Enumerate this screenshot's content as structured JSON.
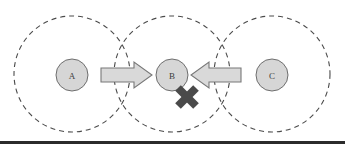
{
  "figure": {
    "name": "three-overlapping-dashed-circles-with-arrows",
    "width": 345,
    "height": 148,
    "background_color": "#ffffff"
  },
  "style": {
    "dashed_circle_stroke": "#4a4a4a",
    "dashed_circle_dash": "5 4",
    "dashed_circle_stroke_width": 1.1,
    "node_fill": "#d6d6d6",
    "node_stroke": "#6e6e6e",
    "node_stroke_width": 1,
    "node_label_color": "#3d3d3d",
    "arrow_fill": "#d9d9d9",
    "arrow_stroke": "#787878",
    "arrow_stroke_width": 1.1,
    "cross_color": "#4a4a4a",
    "bottom_rule_color": "#2b2b2b"
  },
  "regions": [
    {
      "id": "region-a",
      "cx": 72,
      "cy": 74,
      "r": 58,
      "dashed": true
    },
    {
      "id": "region-b",
      "cx": 172,
      "cy": 74,
      "r": 58,
      "dashed": true
    },
    {
      "id": "region-c",
      "cx": 272,
      "cy": 74,
      "r": 58,
      "dashed": true
    }
  ],
  "nodes": [
    {
      "id": "node-a",
      "label": "A",
      "cx": 72,
      "cy": 75,
      "r": 16
    },
    {
      "id": "node-b",
      "label": "B",
      "cx": 172,
      "cy": 75,
      "r": 16
    },
    {
      "id": "node-c",
      "label": "C",
      "cx": 272,
      "cy": 75,
      "r": 16
    }
  ],
  "arrows": [
    {
      "id": "arrow-a-to-b",
      "direction": "right",
      "from": "A",
      "to": "B",
      "points": "101,68 134,68 134,62 152,75 134,88 134,82 101,82"
    },
    {
      "id": "arrow-c-to-b",
      "direction": "left",
      "from": "C",
      "to": "B",
      "points": "241,68 209,68 209,62 191,75 209,88 209,82 241,82"
    }
  ],
  "cross_mark": {
    "id": "cross-mark",
    "cx": 187,
    "cy": 97,
    "arm_half_length": 13,
    "thickness": 8
  },
  "bottom_rule": {
    "id": "bottom-rule",
    "y": 141,
    "thickness": 3
  }
}
